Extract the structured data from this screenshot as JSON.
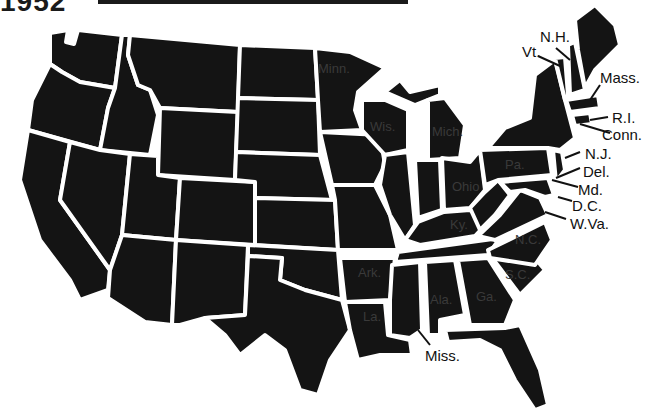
{
  "header": {
    "year": "1952"
  },
  "map": {
    "title": "United States map",
    "fill_color": "#141414",
    "border_color": "#ffffff",
    "callout_labels": [
      {
        "id": "nh",
        "text": "N.H."
      },
      {
        "id": "vt",
        "text": "Vt."
      },
      {
        "id": "mass",
        "text": "Mass."
      },
      {
        "id": "ri",
        "text": "R.I."
      },
      {
        "id": "conn",
        "text": "Conn."
      },
      {
        "id": "nj",
        "text": "N.J."
      },
      {
        "id": "del",
        "text": "Del."
      },
      {
        "id": "md",
        "text": "Md."
      },
      {
        "id": "dc",
        "text": "D.C."
      },
      {
        "id": "wva",
        "text": "W.Va."
      },
      {
        "id": "miss",
        "text": "Miss."
      }
    ],
    "in_state_labels": [
      {
        "id": "minn",
        "text": "Minn."
      },
      {
        "id": "wis",
        "text": "Wis."
      },
      {
        "id": "mich",
        "text": "Mich."
      },
      {
        "id": "pa",
        "text": "Pa."
      },
      {
        "id": "ohio",
        "text": "Ohio"
      },
      {
        "id": "ky",
        "text": "Ky."
      },
      {
        "id": "nc",
        "text": "N.C."
      },
      {
        "id": "sc",
        "text": "S.C."
      },
      {
        "id": "ark",
        "text": "Ark."
      },
      {
        "id": "la",
        "text": "La."
      },
      {
        "id": "ala",
        "text": "Ala."
      },
      {
        "id": "ga",
        "text": "Ga."
      }
    ]
  }
}
